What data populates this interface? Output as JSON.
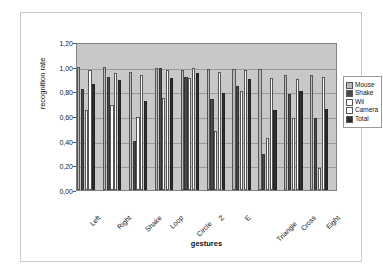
{
  "chart_data": {
    "type": "bar",
    "title": "",
    "xlabel": "gestures",
    "ylabel": "recognition rate",
    "ylim": [
      0,
      1.2
    ],
    "ytick_labels": [
      "1,20",
      "1,00",
      "0,80",
      "0,60",
      "0,40",
      "0,20",
      "0,00"
    ],
    "ytick_values": [
      1.2,
      1.0,
      0.8,
      0.6,
      0.4,
      0.2,
      0.0
    ],
    "grid": true,
    "legend_position": "right",
    "categories": [
      "Left",
      "Right",
      "Shake",
      "Loop",
      "Circle",
      "Z",
      "E",
      "Triangle",
      "Cross",
      "Eight"
    ],
    "series": [
      {
        "name": "Mouse",
        "color": "#b9b9b9",
        "values": [
          1.0,
          1.0,
          0.96,
          0.99,
          0.97,
          0.98,
          0.98,
          0.98,
          0.93,
          0.93
        ]
      },
      {
        "name": "Shake",
        "color": "#4a4a4a",
        "values": [
          0.82,
          0.92,
          0.4,
          0.99,
          0.92,
          0.74,
          0.84,
          0.29,
          0.78,
          0.58
        ]
      },
      {
        "name": "Wii",
        "color": "#ffffff",
        "values": [
          0.65,
          0.69,
          0.59,
          0.75,
          0.91,
          0.48,
          0.8,
          0.42,
          0.58,
          0.18
        ]
      },
      {
        "name": "Camera",
        "color": "#fdfdfd",
        "values": [
          0.97,
          0.95,
          0.93,
          0.97,
          0.99,
          0.96,
          0.97,
          0.91,
          0.9,
          0.92
        ]
      },
      {
        "name": "Total",
        "color": "#2e2e2e",
        "values": [
          0.86,
          0.89,
          0.72,
          0.91,
          0.95,
          0.79,
          0.9,
          0.65,
          0.8,
          0.66
        ]
      }
    ]
  },
  "legend": {
    "items": [
      {
        "label": "Mouse"
      },
      {
        "label": "Shake"
      },
      {
        "label": "Wii"
      },
      {
        "label": "Camera"
      },
      {
        "label": "Total"
      }
    ]
  }
}
